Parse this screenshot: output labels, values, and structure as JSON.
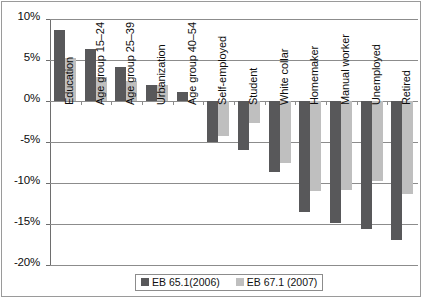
{
  "chart_data": {
    "type": "bar",
    "title": "",
    "xlabel": "",
    "ylabel": "",
    "ylim": [
      -20,
      10
    ],
    "ytick_labels": [
      "10%",
      "5%",
      "0%",
      "-5%",
      "-10%",
      "-15%",
      "-20%"
    ],
    "ytick_values": [
      10,
      5,
      0,
      -5,
      -10,
      -15,
      -20
    ],
    "grid": true,
    "legend_position": "bottom",
    "categories": [
      "Education",
      "Age group 15–24",
      "Age group 25–39",
      "Urbanization",
      "Age group 40–54",
      "Self-employed",
      "Student",
      "White collar",
      "Homemaker",
      "Manual worker",
      "Unemployed",
      "Retired"
    ],
    "series": [
      {
        "name": "EB 65.1(2006)",
        "color": "#58585a",
        "values": [
          8.7,
          6.4,
          4.1,
          1.9,
          1.1,
          -5.0,
          -6.0,
          -8.7,
          -13.5,
          -14.9,
          -15.6,
          -16.9
        ]
      },
      {
        "name": "EB 67.1 (2007)",
        "color": "#bfbfbf",
        "values": [
          5.3,
          2.9,
          2.5,
          2.0,
          null,
          -4.3,
          -2.7,
          -7.5,
          -11.0,
          -10.9,
          -9.7,
          -11.3
        ]
      }
    ]
  },
  "legend": {
    "entries": [
      {
        "label": "EB 65.1(2006)",
        "swatch": "dark"
      },
      {
        "label": "EB 67.1 (2007)",
        "swatch": "light"
      }
    ]
  }
}
